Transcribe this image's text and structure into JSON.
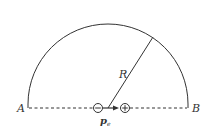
{
  "diagram": {
    "points": {
      "left_label": "A",
      "right_label": "B"
    },
    "radius_label": "R",
    "dipole": {
      "negative_charge_symbol": "−",
      "positive_charge_symbol": "+",
      "moment_label": "p",
      "moment_subscript": "e"
    },
    "colors": {
      "stroke": "#333333",
      "background": "#ffffff"
    }
  }
}
